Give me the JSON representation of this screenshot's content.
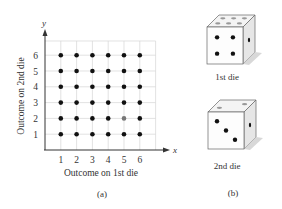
{
  "chart_data": {
    "type": "scatter",
    "title": "",
    "xlabel": "Outcome on 1st die",
    "ylabel": "Outcome on 2nd die",
    "x_axis_letter": "x",
    "y_axis_letter": "y",
    "xlim": [
      0,
      7
    ],
    "ylim": [
      0,
      7
    ],
    "x_ticks": [
      "1",
      "2",
      "3",
      "4",
      "5",
      "6"
    ],
    "y_ticks": [
      "1",
      "2",
      "3",
      "4",
      "5",
      "6"
    ],
    "grid": true,
    "points": [
      {
        "x": 1,
        "y": 1
      },
      {
        "x": 2,
        "y": 1
      },
      {
        "x": 3,
        "y": 1
      },
      {
        "x": 4,
        "y": 1
      },
      {
        "x": 5,
        "y": 1
      },
      {
        "x": 6,
        "y": 1
      },
      {
        "x": 1,
        "y": 2
      },
      {
        "x": 2,
        "y": 2
      },
      {
        "x": 3,
        "y": 2
      },
      {
        "x": 4,
        "y": 2
      },
      {
        "x": 5,
        "y": 2,
        "highlight": true
      },
      {
        "x": 6,
        "y": 2
      },
      {
        "x": 1,
        "y": 3
      },
      {
        "x": 2,
        "y": 3
      },
      {
        "x": 3,
        "y": 3
      },
      {
        "x": 4,
        "y": 3
      },
      {
        "x": 5,
        "y": 3
      },
      {
        "x": 6,
        "y": 3
      },
      {
        "x": 1,
        "y": 4
      },
      {
        "x": 2,
        "y": 4
      },
      {
        "x": 3,
        "y": 4
      },
      {
        "x": 4,
        "y": 4
      },
      {
        "x": 5,
        "y": 4
      },
      {
        "x": 6,
        "y": 4
      },
      {
        "x": 1,
        "y": 5
      },
      {
        "x": 2,
        "y": 5
      },
      {
        "x": 3,
        "y": 5
      },
      {
        "x": 4,
        "y": 5
      },
      {
        "x": 5,
        "y": 5
      },
      {
        "x": 6,
        "y": 5
      },
      {
        "x": 1,
        "y": 6
      },
      {
        "x": 2,
        "y": 6
      },
      {
        "x": 3,
        "y": 6
      },
      {
        "x": 4,
        "y": 6
      },
      {
        "x": 5,
        "y": 6
      },
      {
        "x": 6,
        "y": 6
      }
    ],
    "point_color": "#111111",
    "highlight_color": "#777777",
    "panel_label": "(a)"
  },
  "dice": {
    "first": {
      "label": "1st die",
      "front_face": 4,
      "top_face": 6,
      "side_face": 1
    },
    "second": {
      "label": "2nd die",
      "front_face": 3,
      "top_face": 2,
      "side_face": 1
    },
    "panel_label": "(b)"
  }
}
